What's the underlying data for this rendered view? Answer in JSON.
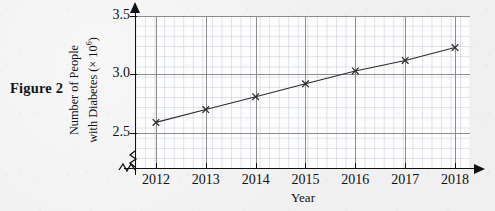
{
  "figure": {
    "label": "Figure 2"
  },
  "chart_data": {
    "type": "line",
    "title": "",
    "xlabel": "Year",
    "ylabel": "Number of People with Diabetes (× 10⁶)",
    "ylabel_line1": "Number of People",
    "ylabel_line2_pre": "with Diabetes (× 10",
    "ylabel_line2_sup": "6",
    "ylabel_line2_post": ")",
    "categories": [
      2012,
      2013,
      2014,
      2015,
      2016,
      2017,
      2018
    ],
    "x_tick_labels": [
      "2012",
      "2013",
      "2014",
      "2015",
      "2016",
      "2017",
      "2018"
    ],
    "values": [
      2.59,
      2.7,
      2.81,
      2.92,
      3.03,
      3.12,
      3.23
    ],
    "y_tick_values": [
      2.5,
      3.0,
      3.5
    ],
    "y_tick_labels": [
      "2.5",
      "3.0",
      "3.5"
    ],
    "ylim": [
      2.2,
      3.5
    ],
    "xlim": [
      2011.6,
      2018.3
    ],
    "grid": true,
    "minor_grid": true,
    "legend": "none",
    "marker": "x-cross",
    "axis_break_x": true,
    "axis_break_y": true,
    "arrow_x": true,
    "arrow_y": true,
    "colors": {
      "line": "#2b2b2b",
      "marker": "#2b2b2b",
      "axis": "#101010",
      "major_grid": "#8d8d8d",
      "minor_grid": "#96a5b9",
      "plot_background": "#fdfdfd",
      "page_background": "#f1f1f1"
    }
  }
}
